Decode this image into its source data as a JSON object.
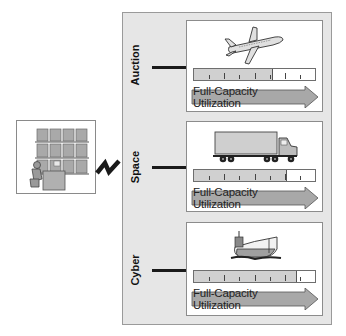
{
  "diagram": {
    "left_illustration": "worker-at-storage-racks",
    "link_symbol": "zigzag-connection",
    "rows": [
      {
        "label": "Auction",
        "vehicle_icon": "airplane-icon",
        "arrow_label": "Full-Capacity Utilization",
        "utilization_fraction": 0.65
      },
      {
        "label": "Space",
        "vehicle_icon": "truck-icon",
        "arrow_label": "Full-Capacity Utilization",
        "utilization_fraction": 0.77
      },
      {
        "label": "Cyber",
        "vehicle_icon": "ship-icon",
        "arrow_label": "Full-Capacity Utilization",
        "utilization_fraction": 0.85
      }
    ],
    "colors": {
      "panel": "#e6e6e6",
      "arrow_fill": "#a8a8a8",
      "meter_fill": "#d0d0d0",
      "connector": "#1a1a1a"
    }
  }
}
